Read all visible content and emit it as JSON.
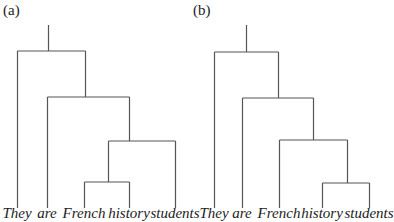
{
  "diagram": {
    "type": "parse-tree-comparison",
    "line_color": "#555555",
    "panels": [
      {
        "label": "(a)",
        "label_x": 3,
        "leaves": [
          {
            "word": "They",
            "x": 17
          },
          {
            "word": "are",
            "x": 47
          },
          {
            "word": "French",
            "x": 84
          },
          {
            "word": "history",
            "x": 129
          },
          {
            "word": "students",
            "x": 175
          }
        ],
        "structure": "[They [are [[French history] students]]]",
        "segments": [
          [
            48,
            25,
            48,
            51
          ],
          [
            17,
            51,
            85,
            51
          ],
          [
            17,
            51,
            17,
            208
          ],
          [
            85,
            51,
            85,
            97
          ],
          [
            47,
            97,
            129,
            97
          ],
          [
            47,
            97,
            47,
            208
          ],
          [
            129,
            97,
            129,
            141
          ],
          [
            108,
            141,
            175,
            141
          ],
          [
            175,
            141,
            175,
            208
          ],
          [
            108,
            141,
            108,
            182
          ],
          [
            84,
            182,
            129,
            182
          ],
          [
            84,
            182,
            84,
            208
          ],
          [
            129,
            182,
            129,
            208
          ]
        ]
      },
      {
        "label": "(b)",
        "label_x": 193,
        "leaves": [
          {
            "word": "They",
            "x": 214
          },
          {
            "word": "are",
            "x": 242
          },
          {
            "word": "French",
            "x": 279
          },
          {
            "word": "history",
            "x": 322
          },
          {
            "word": "students",
            "x": 369
          }
        ],
        "structure": "[They [are [French [history students]]]]",
        "segments": [
          [
            246,
            25,
            246,
            52
          ],
          [
            214,
            52,
            278,
            52
          ],
          [
            214,
            52,
            214,
            208
          ],
          [
            278,
            52,
            278,
            98
          ],
          [
            242,
            98,
            313,
            98
          ],
          [
            242,
            98,
            242,
            208
          ],
          [
            313,
            98,
            313,
            140
          ],
          [
            279,
            140,
            347,
            140
          ],
          [
            279,
            140,
            279,
            208
          ],
          [
            347,
            140,
            347,
            183
          ],
          [
            322,
            183,
            369,
            183
          ],
          [
            322,
            183,
            322,
            208
          ],
          [
            369,
            183,
            369,
            208
          ]
        ]
      }
    ]
  }
}
